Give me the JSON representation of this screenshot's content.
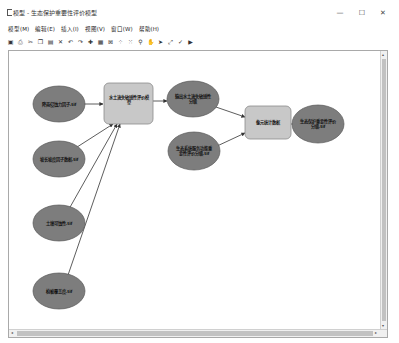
{
  "window": {
    "title": "模型 - 生态保护重要性评价模型",
    "controls": {
      "minimize": "—",
      "maximize": "☐",
      "close": "✕"
    }
  },
  "menu": [
    {
      "label": "模型(M)"
    },
    {
      "label": "编辑(E)"
    },
    {
      "label": "插入(I)"
    },
    {
      "label": "视图(V)"
    },
    {
      "label": "窗口(W)"
    },
    {
      "label": "帮助(H)"
    }
  ],
  "toolbar": [
    {
      "icon": "save-icon",
      "glyph": "▣"
    },
    {
      "icon": "print-icon",
      "glyph": "⎙"
    },
    {
      "icon": "cut-icon",
      "glyph": "✂"
    },
    {
      "icon": "copy-icon",
      "glyph": "❐"
    },
    {
      "icon": "paste-icon",
      "glyph": "▤"
    },
    {
      "icon": "delete-icon",
      "glyph": "✕"
    },
    {
      "icon": "undo-icon",
      "glyph": "↶"
    },
    {
      "icon": "redo-icon",
      "glyph": "↷"
    },
    {
      "icon": "add-data-icon",
      "glyph": "✚"
    },
    {
      "icon": "model-properties-icon",
      "glyph": "▦"
    },
    {
      "icon": "auto-layout-icon",
      "glyph": "⊠"
    },
    {
      "icon": "full-extent-icon",
      "glyph": "⁘"
    },
    {
      "icon": "fixed-zoom-icon",
      "glyph": "⁙"
    },
    {
      "icon": "zoom-icon",
      "glyph": "⚲"
    },
    {
      "icon": "pan-icon",
      "glyph": "✋"
    },
    {
      "icon": "select-icon",
      "glyph": "➤"
    },
    {
      "icon": "connect-icon",
      "glyph": "⤢"
    },
    {
      "icon": "validate-icon",
      "glyph": "✓"
    },
    {
      "icon": "run-icon",
      "glyph": "▶"
    }
  ],
  "colors": {
    "ellipse_fill": "#7d7d7d",
    "ellipse_stroke": "#5a5a5a",
    "box_fill": "#c8c8c8",
    "box_stroke": "#8a8a8a",
    "connector": "#333333"
  },
  "diagram": {
    "inputs": [
      {
        "id": "in1",
        "label": "降雨侵蚀力因子.tif"
      },
      {
        "id": "in2",
        "label": "坡长坡度因子数据.tif"
      },
      {
        "id": "in3",
        "label": "土壤可蚀性.tif"
      },
      {
        "id": "in4",
        "label": "植被覆盖度.tif"
      }
    ],
    "processes": [
      {
        "id": "p1",
        "label": "水土流失敏感性评价模型"
      },
      {
        "id": "p2",
        "label": "像元统计数据"
      }
    ],
    "intermediates": [
      {
        "id": "d1",
        "label": "输出水土流失敏感性分级"
      },
      {
        "id": "d2",
        "label": "生态系统服务功能重要性评价分级.tif"
      }
    ],
    "outputs": [
      {
        "id": "out1",
        "label": "生态保护重要性评价分级.tif"
      }
    ]
  },
  "scrollbars": {
    "left_arrow": "◂",
    "right_arrow": "▸",
    "up_arrow": "▴",
    "down_arrow": "▾"
  }
}
